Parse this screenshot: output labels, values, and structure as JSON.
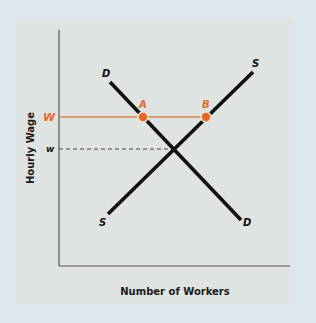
{
  "diagram": {
    "x_axis_label": "Number of Workers",
    "y_axis_label": "Hourly Wage",
    "wage_labels": {
      "high": "W",
      "equilibrium": "w"
    },
    "curves": {
      "demand": {
        "label_top": "D",
        "label_bottom": "D"
      },
      "supply": {
        "label_top": "S",
        "label_bottom": "S"
      }
    },
    "points": {
      "A": "A",
      "B": "B"
    },
    "colors": {
      "accent": "#e2692c",
      "wage_line": "#d9854f",
      "curve": "#111111",
      "panel_bg": "#dfe3e1",
      "page_bg": "#dce8ed"
    }
  }
}
